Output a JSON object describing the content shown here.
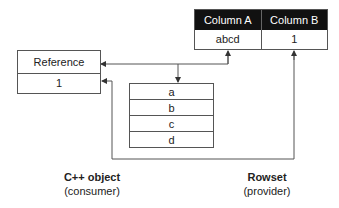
{
  "reference": {
    "title": "Reference",
    "value": "1"
  },
  "rowset_table": {
    "columns": [
      "Column A",
      "Column B"
    ],
    "row": [
      "abcd",
      "1"
    ]
  },
  "string_buffer": {
    "items": [
      "a",
      "b",
      "c",
      "d"
    ]
  },
  "labels": {
    "consumer": {
      "title": "C++ object",
      "subtitle": "(consumer)"
    },
    "provider": {
      "title": "Rowset",
      "subtitle": "(provider)"
    }
  },
  "colors": {
    "header_bg": "#111111",
    "line": "#555555"
  }
}
